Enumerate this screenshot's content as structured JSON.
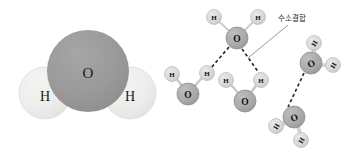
{
  "figure": {
    "background_color": "#ffffff",
    "width": 349,
    "height": 155,
    "panels": [
      {
        "id": "space-filling-water",
        "name": "water-molecule-space-filling",
        "atoms": [
          {
            "element": "O",
            "label": "O",
            "cx": 88,
            "cy": 71,
            "r": 41,
            "fill": "#969696"
          },
          {
            "element": "H",
            "label": "H",
            "cx": 45,
            "cy": 93,
            "r": 26,
            "fill": "#ececea"
          },
          {
            "element": "H",
            "label": "H",
            "cx": 130,
            "cy": 93,
            "r": 26,
            "fill": "#ececea"
          }
        ]
      },
      {
        "id": "hydrogen-bond-network",
        "name": "hydrogen-bond-network",
        "annotation": {
          "text": "수소결합",
          "x": 278,
          "y": 18,
          "pointer": {
            "x1": 288,
            "y1": 25,
            "x2": 248,
            "y2": 58
          }
        },
        "molecules": [
          {
            "name": "molecule-top",
            "oxygen": {
              "label": "O",
              "cx": 237,
              "cy": 38,
              "r": 11
            },
            "hydrogens": [
              {
                "label": "H",
                "cx": 214,
                "cy": 17,
                "r": 7.5
              },
              {
                "label": "H",
                "cx": 258,
                "cy": 17,
                "r": 7.5
              }
            ]
          },
          {
            "name": "molecule-left",
            "oxygen": {
              "label": "O",
              "cx": 188,
              "cy": 94,
              "r": 11
            },
            "hydrogens": [
              {
                "label": "H",
                "cx": 172,
                "cy": 74,
                "r": 7.5
              },
              {
                "label": "H",
                "cx": 207,
                "cy": 73,
                "r": 7.5
              }
            ]
          },
          {
            "name": "molecule-bottom-center",
            "oxygen": {
              "label": "O",
              "cx": 245,
              "cy": 101,
              "r": 11
            },
            "hydrogens": [
              {
                "label": "H",
                "cx": 226,
                "cy": 80,
                "r": 7.5
              },
              {
                "label": "H",
                "cx": 261,
                "cy": 80,
                "r": 7.5
              }
            ]
          },
          {
            "name": "molecule-right",
            "oxygen": {
              "label": "O",
              "cx": 311,
              "cy": 63,
              "r": 11
            },
            "hydrogens": [
              {
                "label": "H",
                "cx": 314,
                "cy": 43,
                "r": 7.5
              },
              {
                "label": "H",
                "cx": 333,
                "cy": 65,
                "r": 7.5
              }
            ]
          },
          {
            "name": "molecule-bottom-right",
            "oxygen": {
              "label": "O",
              "cx": 294,
              "cy": 117,
              "r": 11
            },
            "hydrogens": [
              {
                "label": "H",
                "cx": 276,
                "cy": 126,
                "r": 7.5
              },
              {
                "label": "H",
                "cx": 301,
                "cy": 140,
                "r": 7.5
              }
            ]
          }
        ],
        "hydrogen_bonds": [
          {
            "name": "hbond-top-to-left-h",
            "x1": 229,
            "y1": 47,
            "x2": 211,
            "y2": 68
          },
          {
            "name": "hbond-top-to-bottom-center-h",
            "x1": 242,
            "y1": 49,
            "x2": 259,
            "y2": 73
          },
          {
            "name": "hbond-right-to-bottom-right-o",
            "x1": 304,
            "y1": 73,
            "x2": 288,
            "y2": 107
          }
        ],
        "colors": {
          "oxygen_fill": "#a8a8a8",
          "oxygen_stroke": "#8f8f8f",
          "hydrogen_fill": "#d9d9d9",
          "hydrogen_stroke": "#b8b8b8",
          "covalent_bond": "#c4c4c4",
          "hydrogen_bond": "#2b2b2b",
          "pointer_line": "#8c8c8c"
        }
      }
    ]
  }
}
